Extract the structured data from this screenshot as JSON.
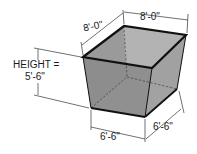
{
  "figure": {
    "type": "frustum-bin",
    "shape": "inverted truncated rectangular pyramid",
    "colors": {
      "face_left": "#8f8f8f",
      "face_right": "#a5a5a5",
      "interior_back": "#b5b5b5",
      "interior_side": "#9d9d9d",
      "interior_floor": "#c4c4c4",
      "edge": "#111111"
    }
  },
  "dimensions": {
    "top_length": "8'-0\"",
    "top_width": "8'-0\"",
    "bottom_length": "6'-6\"",
    "bottom_width": "6'-6\"",
    "height_label": "HEIGHT =",
    "height_value": "5'-6\""
  }
}
